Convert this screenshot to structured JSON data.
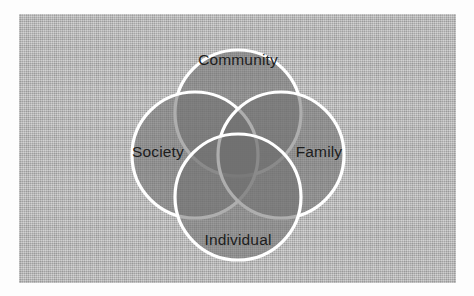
{
  "diagram": {
    "type": "venn-4-circle",
    "title": "",
    "background_color": "#b5b5b5",
    "circle_fill_color": "#7d7d7d",
    "circle_stroke_color": "#ffffff",
    "label_color": "#1d1d1d",
    "circles": [
      {
        "id": "community",
        "label": "Community",
        "position": "top",
        "cx": 219,
        "cy": 99,
        "r": 63,
        "label_x": 219,
        "label_y": 46
      },
      {
        "id": "society",
        "label": "Society",
        "position": "left",
        "cx": 176,
        "cy": 141,
        "r": 63,
        "label_x": 139,
        "label_y": 138
      },
      {
        "id": "family",
        "label": "Family",
        "position": "right",
        "cx": 262,
        "cy": 141,
        "r": 63,
        "label_x": 300,
        "label_y": 138
      },
      {
        "id": "individual",
        "label": "Individual",
        "position": "bottom",
        "cx": 219,
        "cy": 183,
        "r": 63,
        "label_x": 219,
        "label_y": 226
      }
    ]
  }
}
